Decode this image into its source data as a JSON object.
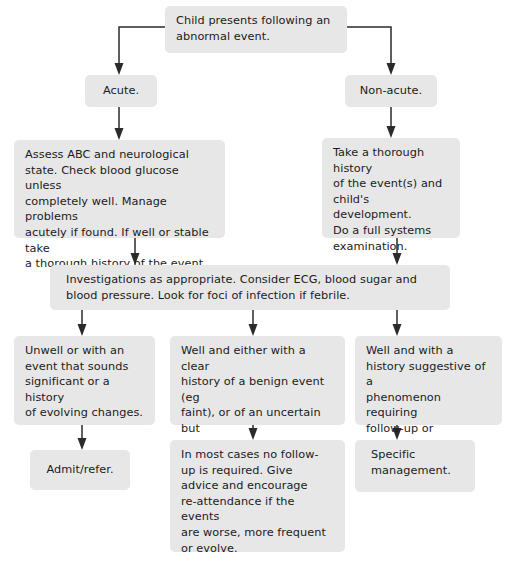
{
  "diagram": {
    "box_fill": "#e7e7e7",
    "line_color": "#2b2b2b",
    "text_color": "#1b1b1b"
  },
  "nodes": {
    "root": "Child presents following an\nabnormal event.",
    "acute": "Acute.",
    "non_acute": "Non-acute.",
    "acute_assessment": "Assess ABC and neurological\nstate. Check blood glucose unless\ncompletely well. Manage problems\nacutely if found. If well or stable take\na thorough history of the event.",
    "non_acute_history": "Take a thorough history\nof the event(s) and\nchild's development.\nDo a full systems\nexamination.",
    "investigations": "Investigations as appropriate. Consider ECG, blood sugar and\nblood pressure. Look for foci of infection if febrile.",
    "outcome_unwell": "Unwell or with an\nevent that sounds\nsignificant or a history\nof evolving changes.",
    "outcome_well_benign": "Well and either with a clear\nhistory of a benign event (eg\nfaint), or of an uncertain but\nun-alarming event.",
    "outcome_well_suggestive": "Well and with a\nhistory suggestive of a\nphenomenon requiring\nfollow-up or treatment.",
    "admit_refer": "Admit/refer.",
    "no_follow_up": "In most cases no follow-\nup is required.  Give\nadvice and encourage\nre-attendance if the events\nare worse, more frequent\nor evolve.",
    "specific_management": "Specific\nmanagement."
  },
  "connectors": [
    {
      "name": "root-to-acute",
      "kind": "elbow-left-down-arrow"
    },
    {
      "name": "root-to-non-acute",
      "kind": "elbow-right-down-arrow"
    },
    {
      "name": "acute-to-assessment",
      "kind": "vertical-arrow"
    },
    {
      "name": "non-acute-to-history",
      "kind": "vertical-arrow"
    },
    {
      "name": "assessment-to-investigations",
      "kind": "vertical-arrow"
    },
    {
      "name": "history-to-investigations",
      "kind": "vertical-arrow"
    },
    {
      "name": "investigations-to-unwell",
      "kind": "vertical-arrow"
    },
    {
      "name": "investigations-to-well-benign",
      "kind": "vertical-arrow"
    },
    {
      "name": "investigations-to-well-suggestive",
      "kind": "vertical-arrow"
    },
    {
      "name": "unwell-to-admit-refer",
      "kind": "vertical-arrow"
    },
    {
      "name": "well-benign-to-no-follow-up",
      "kind": "vertical-arrow"
    },
    {
      "name": "well-suggestive-to-specific-management",
      "kind": "vertical-arrow"
    }
  ]
}
